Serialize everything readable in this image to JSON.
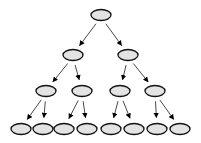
{
  "diagram": {
    "type": "binary-tree",
    "levels": 4,
    "colors": {
      "node_fill": "#e3e3e3",
      "node_stroke": "#111111",
      "edge": "#333333",
      "arrowhead": "#000000"
    },
    "nodes": [
      {
        "id": "n0",
        "level": 0,
        "cx": 101,
        "cy": 15
      },
      {
        "id": "n1",
        "level": 1,
        "cx": 73,
        "cy": 55
      },
      {
        "id": "n2",
        "level": 1,
        "cx": 128,
        "cy": 55
      },
      {
        "id": "n3",
        "level": 2,
        "cx": 46,
        "cy": 91
      },
      {
        "id": "n4",
        "level": 2,
        "cx": 82,
        "cy": 91
      },
      {
        "id": "n5",
        "level": 2,
        "cx": 120,
        "cy": 91
      },
      {
        "id": "n6",
        "level": 2,
        "cx": 155,
        "cy": 91
      },
      {
        "id": "n7",
        "level": 3,
        "cx": 21,
        "cy": 129
      },
      {
        "id": "n8",
        "level": 3,
        "cx": 43,
        "cy": 129
      },
      {
        "id": "n9",
        "level": 3,
        "cx": 64,
        "cy": 129
      },
      {
        "id": "n10",
        "level": 3,
        "cx": 87,
        "cy": 129
      },
      {
        "id": "n11",
        "level": 3,
        "cx": 111,
        "cy": 129
      },
      {
        "id": "n12",
        "level": 3,
        "cx": 134,
        "cy": 129
      },
      {
        "id": "n13",
        "level": 3,
        "cx": 157,
        "cy": 129
      },
      {
        "id": "n14",
        "level": 3,
        "cx": 180,
        "cy": 129
      }
    ],
    "edges": [
      [
        "n0",
        "n1"
      ],
      [
        "n0",
        "n2"
      ],
      [
        "n1",
        "n3"
      ],
      [
        "n1",
        "n4"
      ],
      [
        "n2",
        "n5"
      ],
      [
        "n2",
        "n6"
      ],
      [
        "n3",
        "n7"
      ],
      [
        "n3",
        "n8"
      ],
      [
        "n4",
        "n9"
      ],
      [
        "n4",
        "n10"
      ],
      [
        "n5",
        "n11"
      ],
      [
        "n5",
        "n12"
      ],
      [
        "n6",
        "n13"
      ],
      [
        "n6",
        "n14"
      ]
    ]
  }
}
